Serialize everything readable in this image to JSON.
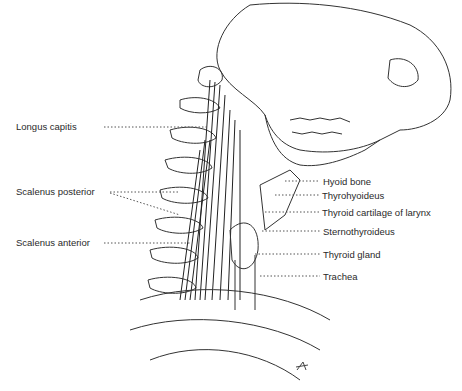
{
  "figure": {
    "labels_left": [
      {
        "text": "Longus capitis",
        "x": 16,
        "y": 121
      },
      {
        "text": "Scalenus posterior",
        "x": 16,
        "y": 186
      },
      {
        "text": "Scalenus anterior",
        "x": 16,
        "y": 237
      }
    ],
    "labels_right": [
      {
        "text": "Hyoid bone",
        "x": 323,
        "y": 176
      },
      {
        "text": "Thyrohyoideus",
        "x": 322,
        "y": 190
      },
      {
        "text": "Thyroid cartilage of larynx",
        "x": 322,
        "y": 207
      },
      {
        "text": "Sternothyroideus",
        "x": 323,
        "y": 226
      },
      {
        "text": "Thyroid gland",
        "x": 323,
        "y": 249
      },
      {
        "text": "Trachea",
        "x": 323,
        "y": 271
      }
    ],
    "signature": "monogram"
  }
}
